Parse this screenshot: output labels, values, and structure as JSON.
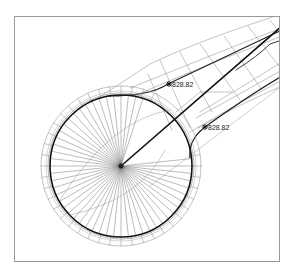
{
  "drawing": {
    "type": "cul-de-sac road layout (CAD plan view)",
    "frame": {
      "x": 14,
      "y": 16,
      "width": 266,
      "height": 246
    },
    "circle": {
      "cx": 121,
      "cy": 166,
      "r_inner": 71,
      "r_outer": 80,
      "spokes": 60
    },
    "colors": {
      "line": "#555555",
      "thick": "#111111",
      "light": "#9a9a9a",
      "frame": "#9a9a9a"
    },
    "labels": [
      {
        "id": "elev-1",
        "text": "828.82",
        "x": 172,
        "y": 81
      },
      {
        "id": "elev-2",
        "text": "828.82",
        "x": 208,
        "y": 124
      }
    ],
    "markers": [
      {
        "id": "marker-1",
        "x": 169,
        "y": 84
      },
      {
        "id": "marker-2",
        "x": 205,
        "y": 127
      }
    ],
    "small_annotations": [
      {
        "text": "R=20",
        "x": 52,
        "y": 186,
        "rotate": -80
      },
      {
        "text": "R=20",
        "x": 182,
        "y": 173,
        "rotate": -80
      }
    ]
  }
}
